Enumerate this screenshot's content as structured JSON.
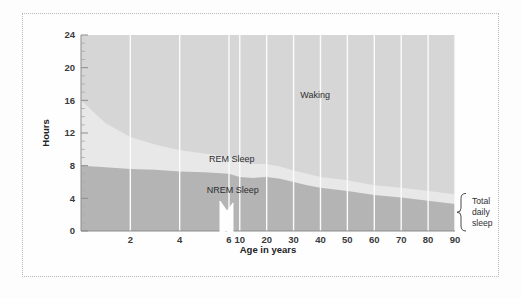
{
  "figure": {
    "kind": "area-chart",
    "background_color": "#fefefe",
    "frame_color": "#b9b9bd"
  },
  "chart_data": {
    "type": "area",
    "title": "",
    "subtitle": "",
    "xlabel": "Age in years",
    "ylabel": "Hours",
    "stacked": true,
    "grid": true,
    "grid_orientation": "vertical",
    "legend_position": "inline-annotations",
    "axis_break": {
      "present": true,
      "between": [
        6,
        10
      ],
      "note": "x-axis scale changes after age 6; zigzag break drawn on axis"
    },
    "ylim": [
      0,
      24
    ],
    "yticks": [
      0,
      4,
      8,
      12,
      16,
      20,
      24
    ],
    "ytick_labels": [
      "0",
      "4",
      "8",
      "12",
      "16",
      "20",
      "24"
    ],
    "yminor_ticks": [
      1,
      2,
      3,
      5,
      6,
      7,
      9,
      10,
      11,
      13,
      14,
      15,
      17,
      18,
      19,
      21,
      22,
      23
    ],
    "xticks": [
      2,
      4,
      6,
      10,
      20,
      30,
      40,
      50,
      60,
      70,
      80,
      90
    ],
    "xtick_labels": [
      "2",
      "4",
      "6",
      "10",
      "20",
      "30",
      "40",
      "50",
      "60",
      "70",
      "80",
      "90"
    ],
    "x": [
      0,
      1,
      2,
      3,
      4,
      5,
      6,
      10,
      15,
      20,
      25,
      30,
      35,
      40,
      50,
      60,
      70,
      80,
      90
    ],
    "series": [
      {
        "name": "NREM Sleep",
        "color": "#b4b4b4",
        "label": "NREM Sleep",
        "values": [
          8.0,
          7.8,
          7.6,
          7.5,
          7.3,
          7.2,
          7.0,
          6.6,
          6.5,
          6.6,
          6.4,
          6.0,
          5.6,
          5.3,
          4.9,
          4.4,
          4.1,
          3.7,
          3.3
        ]
      },
      {
        "name": "REM Sleep",
        "color": "#e8e8e8",
        "label": "REM Sleep",
        "values": [
          8.0,
          5.4,
          3.9,
          3.1,
          2.6,
          2.3,
          2.1,
          1.8,
          1.7,
          1.6,
          1.5,
          1.4,
          1.4,
          1.3,
          1.3,
          1.2,
          1.2,
          1.2,
          1.2
        ]
      },
      {
        "name": "Waking",
        "color": "#d6d6d6",
        "label": "Waking",
        "values": [
          8.0,
          10.8,
          12.5,
          13.4,
          14.1,
          14.5,
          14.9,
          15.6,
          15.8,
          15.8,
          16.1,
          16.6,
          17.0,
          17.4,
          17.8,
          18.4,
          18.7,
          19.1,
          19.5
        ]
      }
    ],
    "annotations": [
      {
        "text": "Waking",
        "x_years": 38,
        "y_hours": 16.3
      },
      {
        "text": "REM Sleep",
        "x_years": 7,
        "y_hours": 8.4
      },
      {
        "text": "NREM Sleep",
        "x_years": 7.4,
        "y_hours": 4.6
      }
    ],
    "bracket": {
      "label_lines": [
        "Total",
        "daily",
        "sleep"
      ],
      "spans_hours": [
        0,
        4.6
      ],
      "at_x_years": 90,
      "side": "right"
    }
  }
}
